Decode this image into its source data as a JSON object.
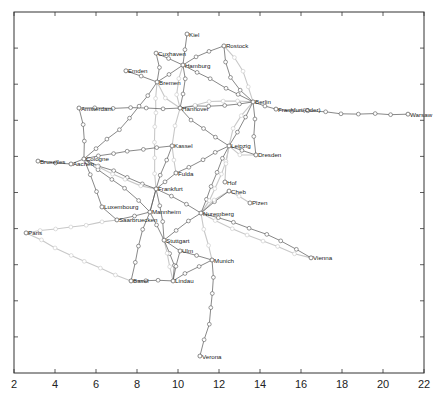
{
  "chart_data": {
    "type": "scatter",
    "title": "",
    "xlabel": "",
    "ylabel": "",
    "xlim": [
      2,
      22
    ],
    "ylim": [
      0,
      10
    ],
    "x_ticks": [
      2,
      4,
      6,
      8,
      10,
      12,
      14,
      16,
      18,
      20,
      22
    ],
    "y_ticks": [
      1,
      2,
      3,
      4,
      5,
      6,
      7,
      8,
      9
    ],
    "y_tick_labels_visible": false,
    "grid": false,
    "legend": null,
    "cities": [
      {
        "name": "Kiel",
        "x": 10.44,
        "y": 9.39
      },
      {
        "name": "Cuxhaven",
        "x": 8.93,
        "y": 8.86
      },
      {
        "name": "Hamburg",
        "x": 10.24,
        "y": 8.53
      },
      {
        "name": "Rostock",
        "x": 12.24,
        "y": 9.06
      },
      {
        "name": "Emden",
        "x": 7.46,
        "y": 8.37
      },
      {
        "name": "Bremen",
        "x": 8.98,
        "y": 8.06
      },
      {
        "name": "Berlin",
        "x": 13.66,
        "y": 7.51
      },
      {
        "name": "Frankfurt(Oder)",
        "x": 14.78,
        "y": 7.31
      },
      {
        "name": "Warsaw",
        "x": 21.22,
        "y": 7.17
      },
      {
        "name": "Amsterdam",
        "x": 5.17,
        "y": 7.34
      },
      {
        "name": "Hannover",
        "x": 10.1,
        "y": 7.34
      },
      {
        "name": "Kassel",
        "x": 9.71,
        "y": 6.29
      },
      {
        "name": "Leipzig",
        "x": 12.49,
        "y": 6.29
      },
      {
        "name": "Dresden",
        "x": 13.8,
        "y": 6.04
      },
      {
        "name": "Bruxelles",
        "x": 3.17,
        "y": 5.87
      },
      {
        "name": "Aachen",
        "x": 4.78,
        "y": 5.79
      },
      {
        "name": "Cologne",
        "x": 5.41,
        "y": 5.93
      },
      {
        "name": "Fulda",
        "x": 9.9,
        "y": 5.54
      },
      {
        "name": "Frankfurt",
        "x": 8.93,
        "y": 5.1
      },
      {
        "name": "Hof",
        "x": 12.29,
        "y": 5.29
      },
      {
        "name": "Cheb",
        "x": 12.49,
        "y": 5.04
      },
      {
        "name": "Plzen",
        "x": 13.51,
        "y": 4.71
      },
      {
        "name": "Luxembourg",
        "x": 6.29,
        "y": 4.6
      },
      {
        "name": "Mannheim",
        "x": 8.63,
        "y": 4.46
      },
      {
        "name": "Saarbruecken",
        "x": 7.02,
        "y": 4.24
      },
      {
        "name": "Nuremberg",
        "x": 11.12,
        "y": 4.43
      },
      {
        "name": "Paris",
        "x": 2.59,
        "y": 3.88
      },
      {
        "name": "Stuttgart",
        "x": 9.32,
        "y": 3.68
      },
      {
        "name": "Ulm",
        "x": 10.1,
        "y": 3.38
      },
      {
        "name": "Munich",
        "x": 11.66,
        "y": 3.13
      },
      {
        "name": "Vienna",
        "x": 16.49,
        "y": 3.19
      },
      {
        "name": "Basel",
        "x": 7.71,
        "y": 2.55
      },
      {
        "name": "Lindau",
        "x": 9.76,
        "y": 2.55
      },
      {
        "name": "Verona",
        "x": 11.07,
        "y": 0.47
      }
    ]
  },
  "axes": {
    "x_tick_labels": [
      "2",
      "4",
      "6",
      "8",
      "10",
      "12",
      "14",
      "16",
      "18",
      "20",
      "22"
    ]
  },
  "colors": {
    "edge_dark": "#555555",
    "edge_light": "#c8c8c8",
    "node": "#555555",
    "label": "#222222",
    "axis": "#333333"
  }
}
